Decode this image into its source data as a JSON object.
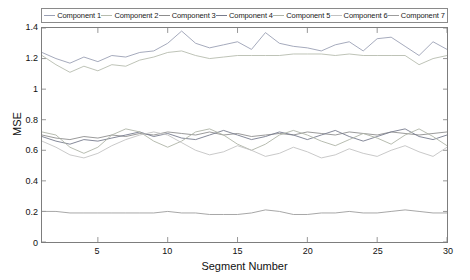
{
  "chart_data": {
    "type": "line",
    "title": "",
    "xlabel": "Segment Number",
    "ylabel": "MSE",
    "xlim": [
      1,
      30
    ],
    "ylim": [
      0,
      1.4
    ],
    "yticks": [
      "0",
      "0.2",
      "0.4",
      "0.6",
      "0.8",
      "1",
      "1.2",
      "1.4"
    ],
    "ytick_values": [
      0,
      0.2,
      0.4,
      0.6,
      0.8,
      1.0,
      1.2,
      1.4
    ],
    "xticks": [
      "5",
      "10",
      "15",
      "20",
      "25",
      "30"
    ],
    "xtick_values": [
      5,
      10,
      15,
      20,
      25,
      30
    ],
    "grid": false,
    "legend_position": "top",
    "x": [
      1,
      2,
      3,
      4,
      5,
      6,
      7,
      8,
      9,
      10,
      11,
      12,
      13,
      14,
      15,
      16,
      17,
      18,
      19,
      20,
      21,
      22,
      23,
      24,
      25,
      26,
      27,
      28,
      29,
      30
    ],
    "series": [
      {
        "name": "Component 1",
        "color": "#9aa0b4",
        "values": [
          1.24,
          1.2,
          1.17,
          1.21,
          1.18,
          1.22,
          1.21,
          1.24,
          1.25,
          1.3,
          1.38,
          1.3,
          1.27,
          1.29,
          1.31,
          1.26,
          1.37,
          1.3,
          1.28,
          1.27,
          1.25,
          1.29,
          1.31,
          1.25,
          1.33,
          1.34,
          1.28,
          1.22,
          1.31,
          1.26
        ]
      },
      {
        "name": "Component 2",
        "color": "#b6bcae",
        "values": [
          1.22,
          1.16,
          1.11,
          1.15,
          1.12,
          1.16,
          1.15,
          1.19,
          1.21,
          1.24,
          1.25,
          1.22,
          1.2,
          1.21,
          1.22,
          1.22,
          1.22,
          1.22,
          1.23,
          1.23,
          1.23,
          1.22,
          1.23,
          1.22,
          1.22,
          1.22,
          1.22,
          1.16,
          1.2,
          1.22
        ]
      },
      {
        "name": "Component 3",
        "color": "#8d8d8d",
        "values": [
          0.7,
          0.68,
          0.67,
          0.69,
          0.68,
          0.7,
          0.69,
          0.71,
          0.7,
          0.72,
          0.71,
          0.7,
          0.72,
          0.7,
          0.71,
          0.69,
          0.7,
          0.71,
          0.7,
          0.72,
          0.71,
          0.7,
          0.72,
          0.71,
          0.7,
          0.72,
          0.71,
          0.7,
          0.71,
          0.72
        ]
      },
      {
        "name": "Component 4",
        "color": "#767b8c",
        "values": [
          0.69,
          0.66,
          0.64,
          0.67,
          0.66,
          0.68,
          0.7,
          0.72,
          0.69,
          0.71,
          0.68,
          0.67,
          0.7,
          0.73,
          0.7,
          0.67,
          0.69,
          0.72,
          0.7,
          0.67,
          0.7,
          0.73,
          0.69,
          0.66,
          0.69,
          0.72,
          0.74,
          0.69,
          0.67,
          0.7
        ]
      },
      {
        "name": "Component 5",
        "color": "#aeb4a6",
        "values": [
          0.72,
          0.7,
          0.62,
          0.58,
          0.62,
          0.7,
          0.74,
          0.72,
          0.66,
          0.62,
          0.66,
          0.72,
          0.74,
          0.7,
          0.64,
          0.6,
          0.64,
          0.7,
          0.73,
          0.7,
          0.66,
          0.63,
          0.67,
          0.71,
          0.68,
          0.64,
          0.7,
          0.74,
          0.69,
          0.63
        ]
      },
      {
        "name": "Component 6",
        "color": "#c2c2c2",
        "values": [
          0.66,
          0.62,
          0.57,
          0.55,
          0.58,
          0.63,
          0.67,
          0.7,
          0.72,
          0.7,
          0.65,
          0.6,
          0.57,
          0.59,
          0.63,
          0.6,
          0.56,
          0.58,
          0.62,
          0.59,
          0.55,
          0.57,
          0.61,
          0.58,
          0.56,
          0.6,
          0.63,
          0.59,
          0.56,
          0.62
        ]
      },
      {
        "name": "Component 7",
        "color": "#9c9c9c",
        "values": [
          0.2,
          0.2,
          0.19,
          0.19,
          0.19,
          0.19,
          0.19,
          0.19,
          0.19,
          0.2,
          0.19,
          0.19,
          0.18,
          0.18,
          0.18,
          0.19,
          0.21,
          0.2,
          0.18,
          0.18,
          0.19,
          0.19,
          0.2,
          0.19,
          0.19,
          0.2,
          0.21,
          0.2,
          0.19,
          0.19
        ]
      }
    ]
  },
  "legend": {
    "items": [
      {
        "label": "Component 1"
      },
      {
        "label": "Component 2"
      },
      {
        "label": "Component 3"
      },
      {
        "label": "Component 4"
      },
      {
        "label": "Component 5"
      },
      {
        "label": "Component 6"
      },
      {
        "label": "Component 7"
      }
    ]
  }
}
